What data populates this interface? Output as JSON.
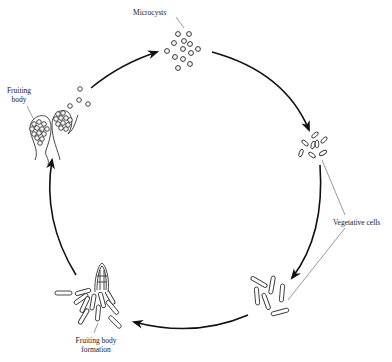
{
  "diagram": {
    "title": "",
    "stages": [
      {
        "id": "microcysts",
        "label": "Microcysts"
      },
      {
        "id": "vegetative-cells",
        "label": "Vegetative cells"
      },
      {
        "id": "fruiting-body-formation",
        "label_line1": "Fruiting body",
        "label_line2": "formation"
      },
      {
        "id": "fruiting-body",
        "label_line1": "Fruiting",
        "label_line2": "body"
      }
    ],
    "flow": [
      "Microcysts",
      "Vegetative cells",
      "Fruiting body formation",
      "Fruiting body",
      "Microcysts"
    ],
    "colors": {
      "stroke": "#111111",
      "background": "#ffffff",
      "text": "#222222"
    }
  }
}
